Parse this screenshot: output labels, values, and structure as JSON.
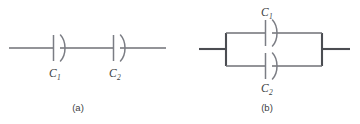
{
  "figure": {
    "background_color": "#ffffff",
    "wire_color": "#6f7176",
    "wire_color_dark": "#4b4d52",
    "plate_color": "#7b7d84",
    "text_color": "#3c3d42",
    "width": 360,
    "height": 124
  },
  "panels": [
    {
      "id": "panel-a",
      "caption": "(a)",
      "arrangement": "series",
      "components": [
        {
          "id": "capacitor-c1-series",
          "symbol": "capacitor",
          "label_main": "C",
          "label_sub": "1"
        },
        {
          "id": "capacitor-c2-series",
          "symbol": "capacitor",
          "label_main": "C",
          "label_sub": "2"
        }
      ]
    },
    {
      "id": "panel-b",
      "caption": "(b)",
      "arrangement": "parallel",
      "components": [
        {
          "id": "capacitor-c1-parallel",
          "symbol": "capacitor",
          "label_main": "C",
          "label_sub": "1"
        },
        {
          "id": "capacitor-c2-parallel",
          "symbol": "capacitor",
          "label_main": "C",
          "label_sub": "2"
        }
      ]
    }
  ]
}
